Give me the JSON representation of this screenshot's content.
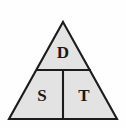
{
  "diagram": {
    "type": "formula-triangle",
    "background_color": "#fefefe",
    "fill_color": "#e3e3e3",
    "stroke_color": "#1c1c1c",
    "geometry": {
      "apex": [
        63,
        22
      ],
      "base_left": [
        9,
        119
      ],
      "base_right": [
        117,
        119
      ],
      "horizontal_divider": {
        "x1": 36,
        "y1": 70,
        "x2": 91,
        "y2": 70
      },
      "vertical_divider": {
        "x1": 63,
        "y1": 70,
        "x2": 63,
        "y2": 119
      }
    },
    "cells": [
      {
        "id": "top",
        "label": "D",
        "meaning": "Distance",
        "position": [
          63,
          53
        ]
      },
      {
        "id": "bottom-left",
        "label": "S",
        "meaning": "Speed",
        "position": [
          42,
          96
        ]
      },
      {
        "id": "bottom-right",
        "label": "T",
        "meaning": "Time",
        "position": [
          84,
          96
        ]
      }
    ]
  }
}
